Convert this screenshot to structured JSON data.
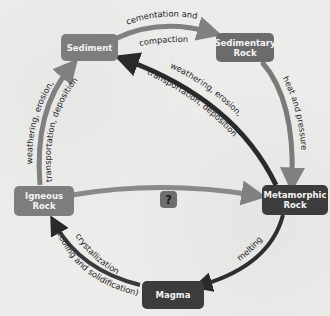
{
  "diagram": {
    "type": "rock-cycle",
    "nodes": {
      "sediment": {
        "label": "Sediment",
        "color": "#7d7d7d"
      },
      "sedimentary_rock": {
        "label": "Sedimentary\nRock",
        "color": "#6b6b6b"
      },
      "metamorphic_rock": {
        "label": "Metamorphic\nRock",
        "color": "#3c3c3c"
      },
      "magma": {
        "label": "Magma",
        "color": "#3c3c3c"
      },
      "igneous_rock": {
        "label": "Igneous\nRock",
        "color": "#7d7d7d"
      },
      "unknown": {
        "label": "?",
        "color": "#6e6e6e"
      }
    },
    "edges": {
      "sediment_to_sedimentary": {
        "label_line1": "cementation and",
        "label_line2": "compaction",
        "color": "#808080"
      },
      "sedimentary_to_metamorphic": {
        "label": "heat and pressure",
        "color": "#7a7a7a"
      },
      "metamorphic_to_sediment": {
        "label_line1": "weathering, erosion,",
        "label_line2": "transportation, deposition",
        "color": "#2a2a2a"
      },
      "metamorphic_to_magma": {
        "label": "melting",
        "color": "#2e2e2e"
      },
      "magma_to_igneous": {
        "label_line1": "crystallization",
        "label_line2": "(cooling and solidification)",
        "color": "#3a3a3a"
      },
      "igneous_to_sediment": {
        "label_line1": "weathering, erosion,",
        "label_line2": "transportation, deposition",
        "color": "#808080"
      },
      "igneous_to_metamorphic": {
        "label": "",
        "color": "#8a8a8a"
      }
    }
  }
}
